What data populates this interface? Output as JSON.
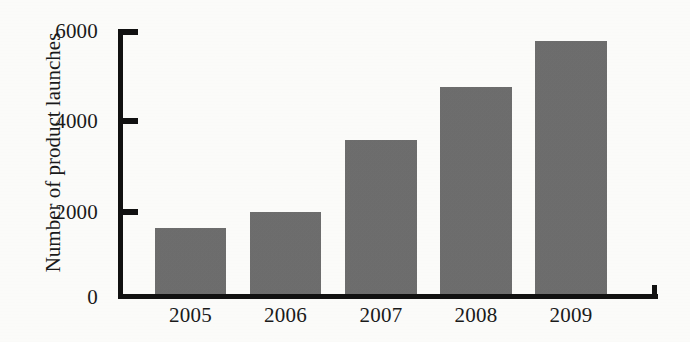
{
  "chart_data": {
    "type": "bar",
    "title": "",
    "xlabel": "",
    "ylabel": "Number of product launches",
    "categories": [
      "2005",
      "2006",
      "2007",
      "2008",
      "2009"
    ],
    "values": [
      1550,
      1910,
      3530,
      4720,
      5750
    ],
    "ylim": [
      0,
      6000
    ],
    "yticks": [
      "0",
      "2000",
      "4000",
      "6000"
    ],
    "ytick_values": [
      0,
      2000,
      4000,
      6000
    ],
    "grid": false,
    "legend": null,
    "bar_color": "#6e6e6e",
    "axis_color": "#111111",
    "background_color": "#fdfdfb"
  }
}
